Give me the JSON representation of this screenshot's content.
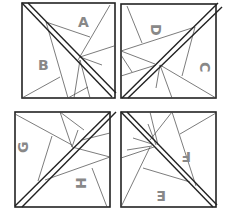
{
  "diagram": {
    "type": "quilt-block-template",
    "layout": "2x2 grid of squares, each split by a double diagonal line",
    "labels": {
      "top_left": [
        "A",
        "B"
      ],
      "top_right": [
        "D",
        "C"
      ],
      "bottom_left": [
        "G",
        "H"
      ],
      "bottom_right": [
        "F",
        "E"
      ]
    },
    "colors": {
      "background": "#ffffff",
      "outline": "#222222",
      "label": "#888888"
    }
  }
}
